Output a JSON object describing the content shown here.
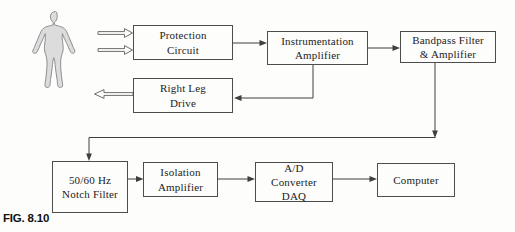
{
  "figure": {
    "label": "FIG. 8.10"
  },
  "blocks": {
    "protection": {
      "label": "Protection\nCircuit"
    },
    "instrumentation": {
      "label": "Instrumentation\nAmplifier"
    },
    "bandpass": {
      "label": "Bandpass Filter\n& Amplifier"
    },
    "right_leg": {
      "label": "Right Leg\nDrive"
    },
    "notch": {
      "label": "50/60 Hz\nNotch Filter"
    },
    "isolation": {
      "label": "Isolation\nAmplifier"
    },
    "adc": {
      "label": "A/D\nConverter\nDAQ"
    },
    "computer": {
      "label": "Computer"
    }
  },
  "icons": {
    "body": "human-body-silhouette",
    "electrode_arrows": "hollow-block-arrow-right",
    "drive_return_arrow": "hollow-block-arrow-left"
  },
  "connections": [
    {
      "from": "body",
      "to": "protection",
      "style": "hollow-double-arrow"
    },
    {
      "from": "protection",
      "to": "instrumentation",
      "style": "solid-arrow"
    },
    {
      "from": "instrumentation",
      "to": "bandpass",
      "style": "solid-arrow"
    },
    {
      "from": "instrumentation",
      "to": "right_leg",
      "style": "solid-arrow-feedback"
    },
    {
      "from": "right_leg",
      "to": "body",
      "style": "hollow-arrow"
    },
    {
      "from": "bandpass",
      "to": "notch",
      "style": "solid-arrow-elbow"
    },
    {
      "from": "notch",
      "to": "isolation",
      "style": "solid-arrow"
    },
    {
      "from": "isolation",
      "to": "adc",
      "style": "solid-arrow"
    },
    {
      "from": "adc",
      "to": "computer",
      "style": "solid-arrow"
    }
  ],
  "colors": {
    "line": "#3f3f3f",
    "box_border": "#4d4d4d",
    "text": "#1c1c1c",
    "body_fill": "#dcdcdc",
    "body_outline": "#8f8f8f",
    "background": "#fdfdfb"
  }
}
